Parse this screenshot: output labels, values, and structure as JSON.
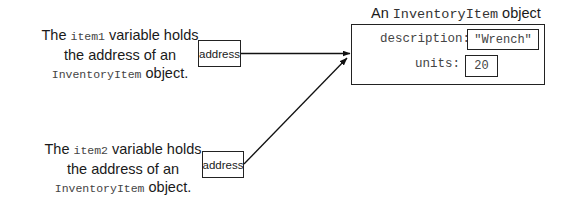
{
  "captions": [
    {
      "prefix": "The ",
      "var": "item1",
      "suffix": " variable holds",
      "line2": "the address of an",
      "class_name": "InventoryItem",
      "line3_suffix": " object."
    },
    {
      "prefix": "The ",
      "var": "item2",
      "suffix": " variable holds",
      "line2": "the address of an",
      "class_name": "InventoryItem",
      "line3_suffix": " object."
    }
  ],
  "variables": [
    {
      "label": "address"
    },
    {
      "label": "address"
    }
  ],
  "object": {
    "title_prefix": "An ",
    "title_class": "InventoryItem",
    "title_suffix": " object",
    "fields": [
      {
        "name": "description:",
        "value": "\"Wrench\""
      },
      {
        "name": "units:",
        "value": "20"
      }
    ]
  }
}
